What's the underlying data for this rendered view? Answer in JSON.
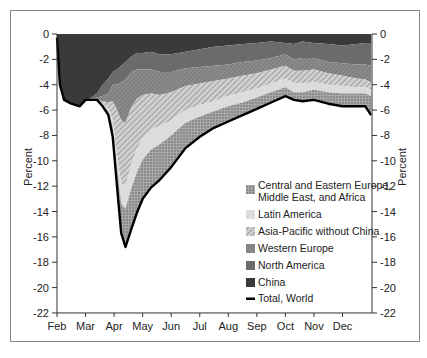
{
  "chart_data": {
    "type": "area",
    "stacked": true,
    "title": "",
    "xlabel": "",
    "ylabel": "Percent",
    "ylabel_right": "Percent",
    "ylim": [
      -22,
      0
    ],
    "yticks": [
      0,
      -2,
      -4,
      -6,
      -8,
      -10,
      -12,
      -14,
      -16,
      -18,
      -20,
      -22
    ],
    "xtick_labels": [
      "Feb",
      "Mar",
      "Apr",
      "May",
      "Jun",
      "Jul",
      "Aug",
      "Sep",
      "Oct",
      "Nov",
      "Dec"
    ],
    "x": [
      0,
      0.1,
      0.25,
      0.5,
      0.8,
      1.0,
      1.2,
      1.4,
      1.6,
      1.8,
      1.95,
      2.1,
      2.25,
      2.4,
      2.6,
      2.8,
      3.0,
      3.3,
      3.6,
      4.0,
      4.5,
      5.0,
      5.5,
      6.0,
      6.5,
      7.0,
      7.5,
      8.0,
      8.3,
      8.6,
      9.0,
      9.5,
      10.0,
      10.5,
      10.8,
      11.0
    ],
    "series": [
      {
        "name": "China",
        "color": "#3a3a3a",
        "pattern": "solid",
        "values": [
          -0.3,
          -4.0,
          -5.2,
          -5.5,
          -5.7,
          -5.3,
          -5.0,
          -4.7,
          -4.0,
          -3.5,
          -3.0,
          -2.8,
          -2.5,
          -2.2,
          -1.8,
          -1.5,
          -1.5,
          -1.4,
          -1.6,
          -1.6,
          -1.4,
          -1.2,
          -1.0,
          -0.9,
          -0.8,
          -0.7,
          -0.6,
          -0.7,
          -0.8,
          -0.6,
          -0.7,
          -0.8,
          -0.9,
          -0.8,
          -0.7,
          -0.7
        ]
      },
      {
        "name": "North America",
        "color": "#6b6b6b",
        "pattern": "solid",
        "values": [
          0,
          0,
          0,
          0,
          0,
          0.1,
          -0.1,
          -0.3,
          -0.9,
          -1.2,
          -1.0,
          -1.2,
          -1.3,
          -1.4,
          -1.2,
          -1.3,
          -1.3,
          -1.4,
          -1.4,
          -1.4,
          -1.3,
          -1.4,
          -1.5,
          -1.5,
          -1.4,
          -1.4,
          -1.3,
          -0.9,
          -1.2,
          -1.3,
          -1.2,
          -1.4,
          -1.4,
          -1.6,
          -1.7,
          -1.8
        ]
      },
      {
        "name": "Western Europe",
        "color": "#8a8a8a",
        "pattern": "hatch-dense",
        "values": [
          0,
          0,
          0,
          0,
          0,
          0,
          -0.1,
          -0.2,
          -0.4,
          -0.7,
          -1.3,
          -2.0,
          -3.0,
          -3.4,
          -2.8,
          -2.3,
          -2.0,
          -1.9,
          -1.8,
          -1.6,
          -1.4,
          -1.3,
          -1.2,
          -1.1,
          -1.1,
          -1.0,
          -0.9,
          -0.9,
          -0.9,
          -1.0,
          -0.9,
          -0.9,
          -1.0,
          -1.1,
          -1.2,
          -1.3
        ]
      },
      {
        "name": "Asia-Pacific without China",
        "color": "#bdbdbd",
        "pattern": "hatch-light",
        "values": [
          0,
          0,
          0,
          0,
          0,
          0,
          0,
          0,
          -0.2,
          -0.5,
          -1.5,
          -3.5,
          -5.0,
          -5.0,
          -4.5,
          -4.0,
          -3.4,
          -2.8,
          -2.5,
          -2.2,
          -1.9,
          -1.7,
          -1.6,
          -1.4,
          -1.3,
          -1.2,
          -1.1,
          -1.0,
          -1.0,
          -1.0,
          -1.0,
          -0.9,
          -0.8,
          -0.7,
          -0.6,
          -0.6
        ]
      },
      {
        "name": "Latin America",
        "color": "#dcdcdc",
        "pattern": "solid",
        "values": [
          0,
          0,
          0,
          0,
          0,
          0,
          0,
          0,
          -0.1,
          -0.2,
          -0.5,
          -1.0,
          -1.6,
          -1.8,
          -1.9,
          -1.8,
          -1.7,
          -1.6,
          -1.4,
          -1.2,
          -1.0,
          -0.9,
          -0.8,
          -0.8,
          -0.8,
          -0.7,
          -0.7,
          -0.7,
          -0.7,
          -0.7,
          -0.6,
          -0.6,
          -0.6,
          -0.5,
          -0.5,
          -0.5
        ]
      },
      {
        "name": "Central and Eastern Europe, Middle East, and Africa",
        "color": "#9e9e9e",
        "pattern": "dots",
        "values": [
          0,
          0,
          0,
          0,
          0,
          0,
          0,
          0,
          -0.1,
          -0.3,
          -0.8,
          -1.5,
          -2.3,
          -3.0,
          -3.2,
          -3.2,
          -3.1,
          -3.0,
          -2.8,
          -2.5,
          -2.0,
          -1.6,
          -1.3,
          -1.2,
          -1.0,
          -0.9,
          -0.8,
          -0.7,
          -0.6,
          -0.7,
          -0.8,
          -0.9,
          -1.0,
          -1.0,
          -1.0,
          -1.5
        ]
      }
    ],
    "total_world": {
      "name": "Total, World",
      "color": "#000000",
      "values": [
        -0.3,
        -4.0,
        -5.2,
        -5.5,
        -5.7,
        -5.2,
        -5.2,
        -5.2,
        -5.7,
        -6.4,
        -8.1,
        -11.0,
        -13.7,
        -15.8,
        -15.4,
        -14.1,
        -13.0,
        -12.1,
        -11.5,
        -10.5,
        -9.0,
        -8.1,
        -7.4,
        -6.9,
        -6.4,
        -5.9,
        -5.4,
        -4.9,
        -5.2,
        -5.3,
        -5.2,
        -5.5,
        -5.7,
        -5.7,
        -5.7,
        -6.4
      ]
    },
    "legend": {
      "position": "lower right inside",
      "entries": [
        "Central and Eastern Europe, Middle East, and Africa",
        "Latin America",
        "Asia-Pacific without China",
        "Western Europe",
        "North America",
        "China",
        "Total, World"
      ]
    }
  },
  "labels": {
    "ylabel_left": "Percent",
    "ylabel_right": "Percent",
    "legend": {
      "ceemea_line1": "Central and Eastern Europe,",
      "ceemea_line2": "Middle East, and Africa",
      "latam": "Latin America",
      "apac": "Asia-Pacific without China",
      "weur": "Western Europe",
      "nam": "North America",
      "china": "China",
      "total": "Total, World"
    }
  }
}
